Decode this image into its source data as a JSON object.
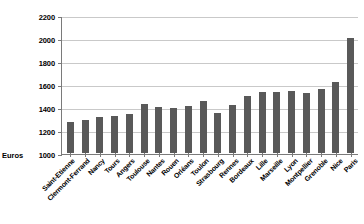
{
  "chart_data": {
    "type": "bar",
    "title": "",
    "subtitle": "",
    "xlabel": "",
    "ylabel": "Euros",
    "ylim": [
      1000,
      2200
    ],
    "ytick_step": 200,
    "yticks": [
      2200,
      2000,
      1800,
      1600,
      1400,
      1200,
      1000
    ],
    "grid": true,
    "legend": false,
    "bar_color": "#595959",
    "gridline_color": "#c9c9c9",
    "axis_color": "#7a7a7a",
    "categories": [
      "Saint-Etienne",
      "Clermont-Ferrand",
      "Nancy",
      "Tours",
      "Angers",
      "Toulouse",
      "Nantes",
      "Rouen",
      "Orléans",
      "Toulon",
      "Strasbourg",
      "Rennes",
      "Bordeaux",
      "Lille",
      "Marseille",
      "Lyon",
      "Montpellier",
      "Grenoble",
      "Nice",
      "Paris"
    ],
    "values": [
      1270,
      1290,
      1310,
      1320,
      1340,
      1430,
      1400,
      1390,
      1410,
      1450,
      1350,
      1420,
      1500,
      1530,
      1530,
      1540,
      1520,
      1560,
      1620,
      2000
    ]
  }
}
